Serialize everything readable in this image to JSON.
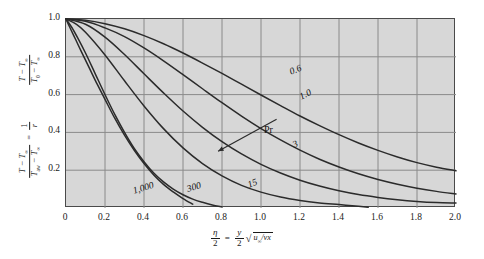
{
  "chart_data": {
    "type": "line",
    "title": "",
    "xlabel": "eta/2 = (y/2) sqrt(u_inf / (nu x))",
    "ylabel": "(T - T_inf)/(T_0 - T_inf) = (T - T_inf)/(T_aw - T_inf) = 1/r",
    "xlim": [
      0,
      2.0
    ],
    "ylim": [
      0,
      1.0
    ],
    "grid": true,
    "legend_position": "inline-curve-labels",
    "x_ticks": [
      "0",
      "0.2",
      "0.4",
      "0.6",
      "0.8",
      "1.0",
      "1.2",
      "1.4",
      "1.6",
      "1.8",
      "2.0"
    ],
    "y_ticks": [
      "0.2",
      "0.4",
      "0.6",
      "0.8",
      "1.0"
    ],
    "x_tick_values": [
      0,
      0.2,
      0.4,
      0.6,
      0.8,
      1.0,
      1.2,
      1.4,
      1.6,
      1.8,
      2.0
    ],
    "y_tick_values": [
      0.2,
      0.4,
      0.6,
      0.8,
      1.0
    ],
    "annotations": [
      {
        "text": "Pr",
        "x": 1.02,
        "y": 0.4
      },
      {
        "text": "arrow indicating increasing Pr direction",
        "from_x": 1.08,
        "from_y": 0.47,
        "to_x": 0.78,
        "to_y": 0.3
      }
    ],
    "series": [
      {
        "name": "0.6",
        "label": "0.6",
        "x": [
          0,
          0.1,
          0.2,
          0.3,
          0.4,
          0.5,
          0.6,
          0.7,
          0.8,
          0.9,
          1.0,
          1.1,
          1.2,
          1.3,
          1.4,
          1.5,
          1.6,
          1.7,
          1.8,
          1.9,
          2.0
        ],
        "y": [
          1.0,
          0.993,
          0.975,
          0.948,
          0.912,
          0.869,
          0.82,
          0.767,
          0.712,
          0.655,
          0.598,
          0.542,
          0.487,
          0.436,
          0.388,
          0.344,
          0.305,
          0.27,
          0.24,
          0.216,
          0.197
        ]
      },
      {
        "name": "1.0",
        "label": "1.0",
        "x": [
          0,
          0.1,
          0.2,
          0.3,
          0.4,
          0.5,
          0.6,
          0.7,
          0.8,
          0.9,
          1.0,
          1.1,
          1.2,
          1.3,
          1.4,
          1.5,
          1.6,
          1.7,
          1.8,
          1.9,
          2.0
        ],
        "y": [
          1.0,
          0.988,
          0.953,
          0.907,
          0.847,
          0.779,
          0.706,
          0.631,
          0.557,
          0.486,
          0.42,
          0.36,
          0.306,
          0.258,
          0.217,
          0.181,
          0.151,
          0.126,
          0.105,
          0.088,
          0.074
        ]
      },
      {
        "name": "3",
        "label": "3",
        "x": [
          0,
          0.1,
          0.2,
          0.3,
          0.4,
          0.5,
          0.6,
          0.7,
          0.8,
          0.9,
          1.0,
          1.1,
          1.2,
          1.3,
          1.4,
          1.5,
          1.6,
          1.7,
          1.8,
          1.9,
          2.0
        ],
        "y": [
          1.0,
          0.972,
          0.904,
          0.812,
          0.71,
          0.609,
          0.513,
          0.427,
          0.351,
          0.286,
          0.231,
          0.185,
          0.147,
          0.116,
          0.091,
          0.071,
          0.056,
          0.044,
          0.035,
          0.029,
          0.026
        ]
      },
      {
        "name": "15",
        "label": "15",
        "x": [
          0,
          0.05,
          0.1,
          0.2,
          0.3,
          0.4,
          0.5,
          0.6,
          0.7,
          0.8,
          0.9,
          1.0,
          1.1,
          1.2,
          1.3,
          1.4,
          1.5,
          1.55
        ],
        "y": [
          1.0,
          0.974,
          0.93,
          0.81,
          0.673,
          0.54,
          0.42,
          0.318,
          0.235,
          0.17,
          0.12,
          0.084,
          0.058,
          0.04,
          0.027,
          0.018,
          0.009,
          0.004
        ]
      },
      {
        "name": "300",
        "label": "300",
        "x": [
          0,
          0.03,
          0.06,
          0.1,
          0.15,
          0.2,
          0.25,
          0.3,
          0.35,
          0.4,
          0.45,
          0.5,
          0.55,
          0.6,
          0.65,
          0.7,
          0.75,
          0.8
        ],
        "y": [
          1.0,
          0.955,
          0.9,
          0.82,
          0.71,
          0.6,
          0.495,
          0.4,
          0.315,
          0.245,
          0.185,
          0.138,
          0.1,
          0.07,
          0.047,
          0.03,
          0.016,
          0.006
        ]
      },
      {
        "name": "1,000",
        "label": "1,000",
        "x": [
          0,
          0.02,
          0.05,
          0.08,
          0.12,
          0.16,
          0.2,
          0.25,
          0.3,
          0.35,
          0.4,
          0.45,
          0.5,
          0.55,
          0.6,
          0.65
        ],
        "y": [
          1.0,
          0.955,
          0.89,
          0.825,
          0.74,
          0.655,
          0.575,
          0.475,
          0.385,
          0.305,
          0.235,
          0.175,
          0.125,
          0.085,
          0.05,
          0.02
        ]
      }
    ],
    "curve_label_positions": [
      {
        "label": "0.6",
        "px": 290,
        "py": 67,
        "rotate": -22
      },
      {
        "label": "1.0",
        "px": 300,
        "py": 92,
        "rotate": -26
      },
      {
        "label": "3",
        "px": 293,
        "py": 140,
        "rotate": -24
      },
      {
        "label": "15",
        "px": 248,
        "py": 180,
        "rotate": -21
      },
      {
        "label": "300",
        "px": 187,
        "py": 184,
        "rotate": -16
      },
      {
        "label": "1,000",
        "px": 133,
        "py": 186,
        "rotate": -17
      }
    ]
  },
  "axes": {
    "y_label_top": {
      "numerator": "T − T",
      "numerator_sub": "∞",
      "denominator": "T",
      "denominator_sub": "0",
      "denominator_rest": " − T",
      "denominator_sub2": "∞"
    },
    "y_label_bottom": {
      "numerator": "T − T",
      "numerator_sub": "∞",
      "denominator": "T",
      "denominator_sub": "aw",
      "denominator_rest": " − T",
      "denominator_sub2": "∞",
      "equals": "=",
      "rhs_num": "1",
      "rhs_den": "r"
    },
    "x_label": {
      "lhs_num": "η",
      "lhs_den": "2",
      "equals": "=",
      "rhs_num": "y",
      "rhs_den": "2",
      "radical": "√",
      "under_radical_num": "u",
      "under_radical_sub": "∞",
      "under_radical_slash": "/",
      "under_radical_den": "νx"
    }
  },
  "colors": {
    "plot_background": "#d7d7d7",
    "grid": "#8a8a8a",
    "curve": "#2b2b2b",
    "frame": "#4a4a4a",
    "text": "#1a1a1a",
    "page_background": "#ffffff"
  }
}
